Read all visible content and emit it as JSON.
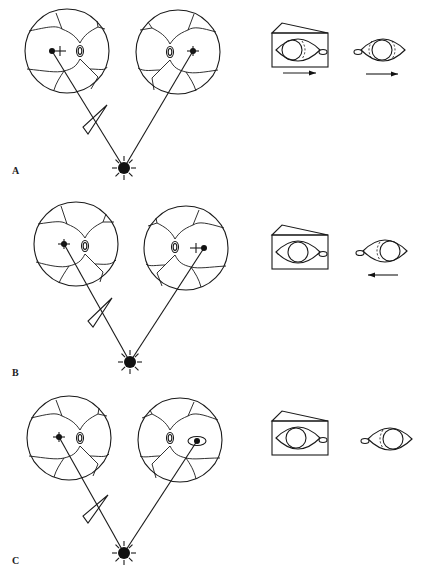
{
  "figure": {
    "type": "ophthalmic diagram",
    "colors": {
      "ink": "#1a1a1a",
      "background": "#ffffff"
    }
  },
  "panels": [
    {
      "label": "A",
      "label_pos": [
        12,
        174
      ],
      "left_fundus": {
        "cx": 67,
        "cy": 51,
        "r": 42,
        "fovea": [
          52,
          51
        ],
        "cross": [
          60,
          51
        ],
        "disc": [
          80,
          51
        ]
      },
      "right_fundus": {
        "cx": 178,
        "cy": 52,
        "r": 42,
        "fovea": [
          193,
          51
        ],
        "cross": null,
        "disc": [
          170,
          52
        ]
      },
      "light": [
        124,
        168
      ],
      "prism": {
        "tip": [
          107,
          105
        ],
        "base1": [
          83,
          127
        ],
        "base2": [
          88,
          134
        ]
      },
      "boxed_eye": {
        "x": 272,
        "y": 33,
        "w": 56,
        "h": 34,
        "iris_cx": 292,
        "dashed": "right"
      },
      "small_eye": {
        "cx": 383,
        "cy": 50,
        "iris_cx": 382,
        "dashed": "both"
      },
      "arrow_box": {
        "x1": 283,
        "x2": 316,
        "y": 73,
        "dir": "right"
      },
      "arrow_eye": {
        "x1": 366,
        "x2": 398,
        "y": 74,
        "dir": "right"
      }
    },
    {
      "label": "B",
      "label_pos": [
        12,
        376
      ],
      "left_fundus": {
        "cx": 76,
        "cy": 244,
        "r": 42,
        "fovea": [
          64,
          244
        ],
        "cross": [
          64,
          244
        ],
        "disc": [
          85,
          246
        ]
      },
      "right_fundus": {
        "cx": 186,
        "cy": 248,
        "r": 42,
        "fovea": [
          204,
          248
        ],
        "cross": [
          196,
          248
        ],
        "disc": [
          175,
          247
        ]
      },
      "light": [
        130,
        362
      ],
      "prism": {
        "tip": [
          112,
          298
        ],
        "base1": [
          88,
          321
        ],
        "base2": [
          93,
          327
        ]
      },
      "boxed_eye": {
        "x": 272,
        "y": 235,
        "w": 56,
        "h": 34,
        "iris_cx": 298,
        "dashed": "none"
      },
      "small_eye": {
        "cx": 385,
        "cy": 251,
        "iris_cx": 390,
        "dashed": "left"
      },
      "arrow_box": null,
      "arrow_eye": {
        "x1": 368,
        "x2": 398,
        "y": 275,
        "dir": "left"
      }
    },
    {
      "label": "C",
      "label_pos": [
        12,
        564
      ],
      "left_fundus": {
        "cx": 69,
        "cy": 438,
        "r": 42,
        "fovea": [
          59,
          437
        ],
        "cross": [
          59,
          437
        ],
        "disc": [
          80,
          438
        ]
      },
      "right_fundus": {
        "cx": 180,
        "cy": 440,
        "r": 42,
        "fovea": [
          197,
          441
        ],
        "cross": null,
        "disc": [
          170,
          438
        ],
        "ring": true
      },
      "light": [
        124,
        553
      ],
      "prism": {
        "tip": [
          108,
          495
        ],
        "base1": [
          83,
          516
        ],
        "base2": [
          88,
          523
        ]
      },
      "boxed_eye": {
        "x": 272,
        "y": 421,
        "w": 56,
        "h": 34,
        "iris_cx": 296,
        "dashed": "none"
      },
      "small_eye": {
        "cx": 390,
        "cy": 439,
        "iris_cx": 393,
        "dashed": "left"
      },
      "arrow_box": null,
      "arrow_eye": null
    }
  ]
}
